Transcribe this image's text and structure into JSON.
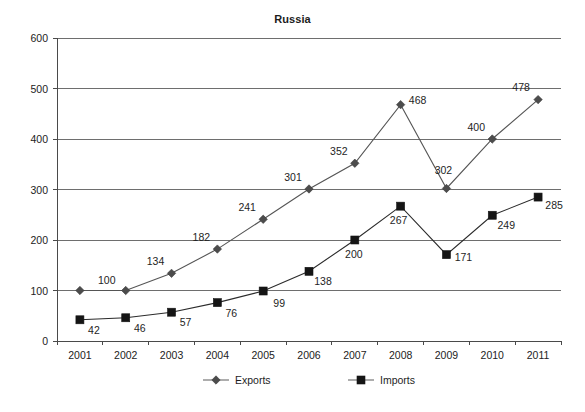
{
  "chart_data": {
    "type": "line",
    "title": "Russia",
    "xlabel": "",
    "ylabel": "",
    "categories": [
      "2001",
      "2002",
      "2003",
      "2004",
      "2005",
      "2006",
      "2007",
      "2008",
      "2009",
      "2010",
      "2011"
    ],
    "ylim": [
      0,
      600
    ],
    "yticks": [
      0,
      100,
      200,
      300,
      400,
      500,
      600
    ],
    "ytick_labels": [
      "0",
      "100",
      "200",
      "300",
      "400",
      "500",
      "600"
    ],
    "grid": true,
    "legend_position": "bottom",
    "series": [
      {
        "name": "Exports",
        "marker": "diamond",
        "color": "#4c4c4c",
        "values": [
          100,
          100,
          134,
          182,
          241,
          301,
          352,
          468,
          302,
          400,
          478
        ],
        "point_labels": [
          "",
          "100",
          "134",
          "182",
          "241",
          "301",
          "352",
          "468",
          "302",
          "400",
          "478"
        ]
      },
      {
        "name": "Imports",
        "marker": "square",
        "color": "#151515",
        "values": [
          42,
          46,
          57,
          76,
          99,
          138,
          200,
          267,
          171,
          249,
          285
        ],
        "point_labels": [
          "42",
          "46",
          "57",
          "76",
          "99",
          "138",
          "200",
          "267",
          "171",
          "249",
          "285"
        ]
      }
    ]
  },
  "legend": {
    "items": [
      {
        "label": "Exports",
        "marker": "diamond-icon"
      },
      {
        "label": "Imports",
        "marker": "square-icon"
      }
    ]
  },
  "axis": {
    "y_labels": [
      "600",
      "500",
      "400",
      "300",
      "200",
      "100",
      "0"
    ],
    "x_labels": [
      "2001",
      "2002",
      "2003",
      "2004",
      "2005",
      "2006",
      "2007",
      "2008",
      "2009",
      "2010",
      "2011"
    ]
  },
  "point_label_text": {
    "exports": [
      "100",
      "134",
      "182",
      "241",
      "301",
      "352",
      "468",
      "302",
      "400",
      "478"
    ],
    "imports": [
      "42",
      "46",
      "57",
      "76",
      "99",
      "138",
      "200",
      "267",
      "171",
      "249",
      "285"
    ]
  },
  "colors": {
    "exports": "#4c4c4c",
    "imports": "#151515",
    "grid": "#6e6e6e",
    "axis": "#4a4a4a",
    "text": "#1e1e1e",
    "background": "#ffffff"
  }
}
